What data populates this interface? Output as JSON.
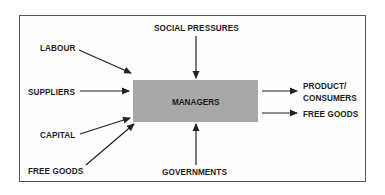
{
  "diagram": {
    "center": {
      "label": "MANAGERS",
      "fill_color": "#a8a8a8"
    },
    "inputs": [
      {
        "label": "LABOUR",
        "direction": "left-upper"
      },
      {
        "label": "SUPPLIERS",
        "direction": "left"
      },
      {
        "label": "CAPITAL",
        "direction": "left-lower"
      },
      {
        "label": "FREE GOODS",
        "direction": "bottom-left"
      },
      {
        "label": "SOCIAL PRESSURES",
        "direction": "top"
      },
      {
        "label": "GOVERNMENTS",
        "direction": "bottom"
      }
    ],
    "outputs": [
      {
        "label_line1": "PRODUCT/",
        "label_line2": "CONSUMERS"
      },
      {
        "label_line1": "FREE GOODS"
      }
    ],
    "colors": {
      "frame_border": "#555555",
      "arrow": "#222222",
      "text": "#1e1e1e"
    }
  }
}
